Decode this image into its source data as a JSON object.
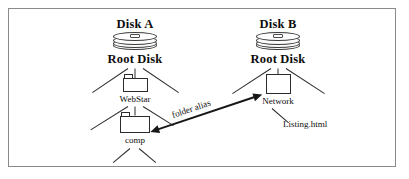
{
  "diagram": {
    "title_text": "",
    "frame_color": "#8a8a8a",
    "line_color": "#2e2e2e",
    "text_color": "#0d0d0d",
    "disk_a": {
      "title": "Disk A",
      "icon": "disk-stack-icon",
      "root_label": "Root Disk",
      "child_folder": "WebStar",
      "grandchild_folder": "comp"
    },
    "disk_b": {
      "title": "Disk B",
      "icon": "disk-stack-icon",
      "root_label": "Root Disk",
      "child_folder": "Network",
      "leaf_file": "Listing.html"
    },
    "alias": {
      "label": "folder alias",
      "arrow": "double-headed-arrow"
    }
  }
}
